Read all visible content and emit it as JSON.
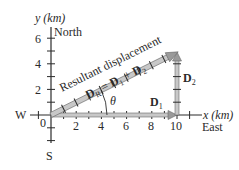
{
  "axes": {
    "x_label": "x (km)",
    "x_direction": "East",
    "y_label": "y (km)",
    "y_direction": "North",
    "west_label": "W",
    "south_label": "S",
    "origin_label": "0",
    "x_ticks": [
      "2",
      "4",
      "6",
      "8",
      "10"
    ],
    "y_ticks": [
      "2",
      "4",
      "6"
    ]
  },
  "vectors": {
    "resultant_caption": "Resultant displacement",
    "resultant_symbol": "D",
    "resultant_sub": "R",
    "equation_eq": " = ",
    "d1_symbol": "D",
    "d1_sub": "1",
    "plus": " + ",
    "d2_symbol": "D",
    "d2_sub": "2",
    "angle_label": "θ"
  },
  "geometry": {
    "d1_km": [
      10,
      0
    ],
    "d2_km": [
      0,
      5
    ],
    "resultant_km": [
      10,
      5
    ]
  },
  "colors": {
    "ink": "#2a2a2a",
    "vector_fill": "#c8c8c8",
    "vector_edge": "#6a6a6a"
  }
}
